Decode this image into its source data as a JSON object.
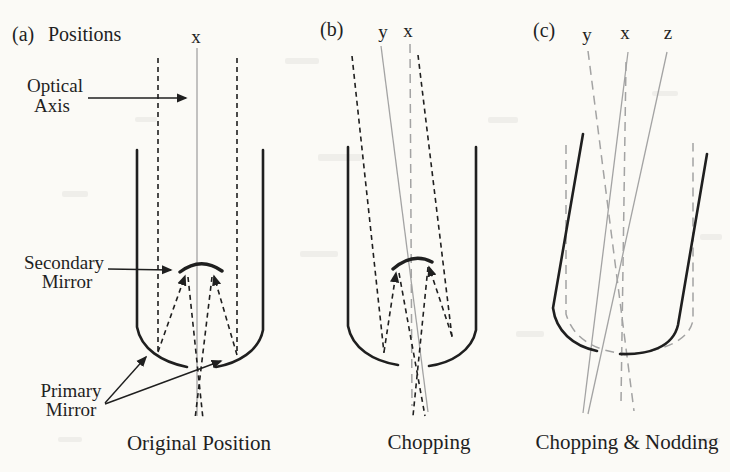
{
  "figure": {
    "colors": {
      "ink": "#1f1f1f",
      "gray": "#a3a3a3",
      "paper": "#fbfaf6"
    },
    "panels": [
      {
        "tag": "(a)",
        "heading": "Positions",
        "caption": "Original Position",
        "axis_labels": {
          "x": "x"
        },
        "callouts": {
          "optical_axis": {
            "line1": "Optical",
            "line2": "Axis"
          },
          "secondary_mirror": {
            "line1": "Secondary",
            "line2": "Mirror"
          },
          "primary_mirror": {
            "line1": "Primary",
            "line2": "Mirror"
          }
        }
      },
      {
        "tag": "(b)",
        "caption": "Chopping",
        "axis_labels": {
          "y": "y",
          "x": "x"
        }
      },
      {
        "tag": "(c)",
        "caption": "Chopping & Nodding",
        "axis_labels": {
          "y": "y",
          "x": "x",
          "z": "z"
        }
      }
    ]
  }
}
